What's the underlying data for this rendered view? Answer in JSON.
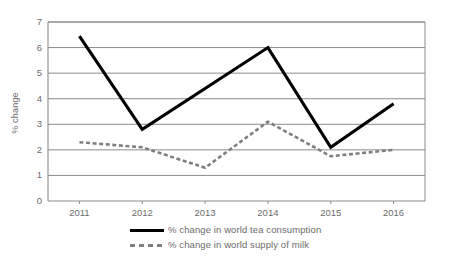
{
  "chart_data": {
    "type": "line",
    "title": "",
    "xlabel": "",
    "ylabel": "% change",
    "categories": [
      "2011",
      "2012",
      "2013",
      "2014",
      "2015",
      "2016"
    ],
    "ylim": [
      0,
      7
    ],
    "yticks": [
      0,
      1,
      2,
      3,
      4,
      5,
      6,
      7
    ],
    "grid": true,
    "legend_position": "bottom",
    "series": [
      {
        "name": "% change in world tea consumption",
        "values": [
          6.45,
          2.8,
          4.4,
          6.0,
          2.1,
          3.8
        ],
        "style": "solid",
        "color": "#000000"
      },
      {
        "name": "% change in world supply of milk",
        "values": [
          2.3,
          2.1,
          1.3,
          3.1,
          1.75,
          2.0
        ],
        "style": "dashed",
        "color": "#7f7f7f"
      }
    ]
  },
  "legend": {
    "items": [
      {
        "label": "% change in world tea consumption",
        "marker": "solid-line-swatch"
      },
      {
        "label": "% change in world supply of milk",
        "marker": "dashed-line-swatch"
      }
    ]
  },
  "axes": {
    "y_title": "% change",
    "y_tick_labels": [
      "7",
      "6",
      "5",
      "4",
      "3",
      "2",
      "1",
      "0"
    ],
    "x_tick_labels": [
      "2011",
      "2012",
      "2013",
      "2014",
      "2015",
      "2016"
    ]
  }
}
